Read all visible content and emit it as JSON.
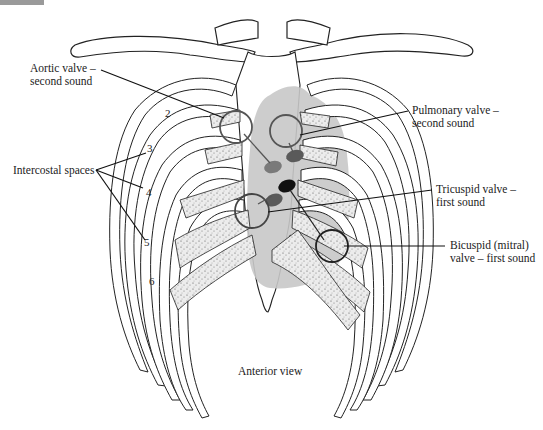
{
  "figure": {
    "title": "Anterior view",
    "heart_shadow_color": "#c8c8c8",
    "valve_colors": {
      "aortic": "#7a7a7a",
      "pulmonary": "#5a5a5a",
      "tricuspid": "#111111",
      "mitral": "#5a5a5a"
    }
  },
  "labels": {
    "aortic_line1": "Aortic valve –",
    "aortic_line2": "second sound",
    "pulmonary_line1": "Pulmonary valve –",
    "pulmonary_line2": "second sound",
    "tricuspid_line1": "Tricuspid valve –",
    "tricuspid_line2": "first sound",
    "mitral_line1": "Bicuspid (mitral)",
    "mitral_line2": "valve – first sound",
    "intercostal": "Intercostal spaces"
  },
  "rib_numbers": [
    "2",
    "3",
    "4",
    "5",
    "6"
  ]
}
